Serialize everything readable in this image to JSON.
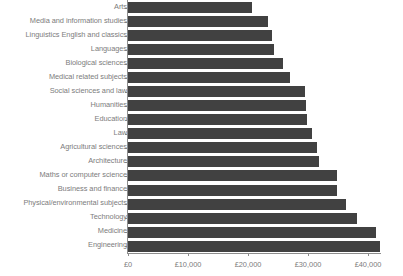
{
  "chart_data": {
    "type": "bar",
    "orientation": "horizontal",
    "title": "",
    "subtitle": "",
    "xlabel": "",
    "ylabel": "",
    "categories": [
      "Arts",
      "Media and information studies",
      "Linguistics English and classics",
      "Languages",
      "Biological sciences",
      "Medical related subjects",
      "Social sciences and law",
      "Humanities",
      "Education",
      "Law",
      "Agricultural sciences",
      "Architecture",
      "Maths or computer science",
      "Business and finance",
      "Physical/environmental subjects",
      "Technology",
      "Medicine",
      "Engineering"
    ],
    "values": [
      20600,
      23300,
      24000,
      24300,
      25800,
      27000,
      29500,
      29700,
      29800,
      30600,
      31500,
      31800,
      34800,
      34800,
      36300,
      38200,
      41400,
      42000
    ],
    "value_prefix": "£",
    "xlim": [
      0,
      45000
    ],
    "xticks": [
      0,
      10000,
      20000,
      30000,
      40000
    ],
    "xtick_labels": [
      "£0",
      "£10,000",
      "£20,000",
      "£30,000",
      "£40,000"
    ],
    "grid": false,
    "legend": false,
    "bar_color": "#414141",
    "axis_color": "#8d8d8d",
    "label_color": "#7c7c7c",
    "background_color": "#ffffff"
  }
}
